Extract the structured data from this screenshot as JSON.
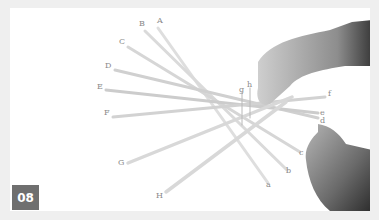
{
  "figure": {
    "step_number": "08",
    "colors": {
      "background": "#efefef",
      "photo_bg": "#ffffff",
      "badge_bg": "#6f6f6f",
      "badge_text": "#ffffff",
      "label_text": "#8a8a8a"
    },
    "labels_upper": [
      {
        "text": "A",
        "x": 157,
        "y": 21
      },
      {
        "text": "B",
        "x": 139,
        "y": 24
      },
      {
        "text": "C",
        "x": 119,
        "y": 42
      },
      {
        "text": "D",
        "x": 105,
        "y": 66
      },
      {
        "text": "E",
        "x": 97,
        "y": 87
      },
      {
        "text": "F",
        "x": 104,
        "y": 113
      },
      {
        "text": "G",
        "x": 118,
        "y": 163
      },
      {
        "text": "H",
        "x": 156,
        "y": 196
      }
    ],
    "labels_lower": [
      {
        "text": "a",
        "x": 267,
        "y": 185
      },
      {
        "text": "b",
        "x": 286,
        "y": 171
      },
      {
        "text": "c",
        "x": 299,
        "y": 153
      },
      {
        "text": "d",
        "x": 320,
        "y": 121
      },
      {
        "text": "e",
        "x": 320,
        "y": 113
      },
      {
        "text": "f",
        "x": 328,
        "y": 94
      },
      {
        "text": "g",
        "x": 240,
        "y": 90
      },
      {
        "text": "h",
        "x": 248,
        "y": 85
      }
    ]
  }
}
